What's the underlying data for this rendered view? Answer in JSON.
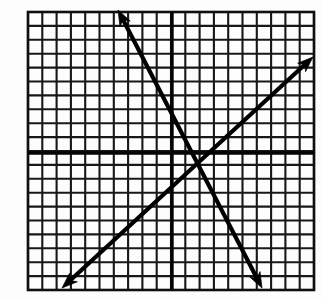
{
  "figure": {
    "kind": "coordinate-grid-graph",
    "background_color": "#ffffff",
    "ink_color": "#000000",
    "caption": ""
  },
  "grid": {
    "columns": 20,
    "rows": 20,
    "left_px": 28,
    "top_px": 12,
    "right_px": 314,
    "bottom_px": 290,
    "cell_width_px": 14.3,
    "cell_height_px": 13.9,
    "minor_line_color": "#181818",
    "minor_line_width_px": 2.1,
    "frame_color": "#101010",
    "frame_width_px": 2.6,
    "has_labels": false,
    "has_tick_numbers": false
  },
  "axes": {
    "x_axis": {
      "name": "x-axis",
      "orientation": "horizontal",
      "position_px": 153,
      "grid_row_index": 10,
      "color": "#050505",
      "line_width_px": 3.4,
      "label": "",
      "arrowheads": false
    },
    "y_axis": {
      "name": "y-axis",
      "orientation": "vertical",
      "position_px": 172,
      "grid_column_index": 10,
      "color": "#050505",
      "line_width_px": 3.4,
      "label": "",
      "arrowheads": false
    },
    "origin_px": {
      "x": 172,
      "y": 153
    },
    "origin_coordinate": {
      "x": 0,
      "y": 0
    },
    "x_range": [
      -10,
      10
    ],
    "y_range": [
      -10,
      10
    ]
  },
  "chart_data": {
    "type": "line",
    "title": "",
    "subtitle": "",
    "xlabel": "",
    "ylabel": "",
    "xlim": [
      -10,
      10
    ],
    "ylim": [
      -10,
      10
    ],
    "grid": true,
    "legend": false,
    "legend_position": "none",
    "annotations": [],
    "tick_labels": {
      "x": [],
      "y": []
    },
    "series": [
      {
        "name": "descending-line",
        "style": "double-headed-arrow",
        "color": "#000000",
        "stroke_width_px": 4.2,
        "slope": -2,
        "y_intercept": 4,
        "equation": "y = -2x + 4",
        "endpoints_px": [
          {
            "x": 118,
            "y": 10
          },
          {
            "x": 262,
            "y": 288
          }
        ],
        "endpoints_graph": [
          {
            "x": -3.8,
            "y": 10.3
          },
          {
            "x": 6.3,
            "y": -9.7
          }
        ],
        "arrow_start": true,
        "arrow_end": true
      },
      {
        "name": "ascending-line",
        "style": "double-headed-arrow",
        "color": "#000000",
        "stroke_width_px": 4.2,
        "slope": 1,
        "y_intercept": -1,
        "equation": "y = x - 1",
        "endpoints_px": [
          {
            "x": 62,
            "y": 288
          },
          {
            "x": 313,
            "y": 57
          }
        ],
        "endpoints_graph": [
          {
            "x": -7.7,
            "y": -9.7
          },
          {
            "x": 9.9,
            "y": 6.9
          }
        ],
        "arrow_start": true,
        "arrow_end": true
      }
    ],
    "intersection_px": {
      "x": 195,
      "y": 163
    },
    "intersection_graph": {
      "x": 1.6,
      "y": -0.7
    }
  }
}
